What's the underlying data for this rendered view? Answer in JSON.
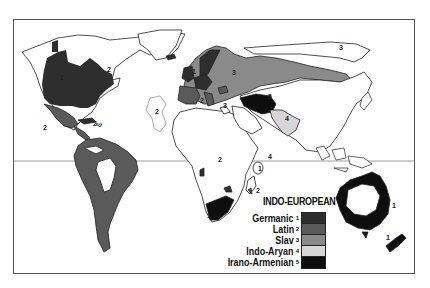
{
  "map": {
    "title": "INDO-EUROPEAN",
    "legend": [
      {
        "number": "1",
        "label": "Germanic",
        "color": "#2e2e2e"
      },
      {
        "number": "2",
        "label": "Latin",
        "color": "#5a5a5a"
      },
      {
        "number": "3",
        "label": "Slav",
        "color": "#8a8a8a"
      },
      {
        "number": "4",
        "label": "Indo-Aryan",
        "color": "#d6d6d6"
      },
      {
        "number": "5",
        "label": "Irano-Armenian",
        "color": "#0e0e0e"
      }
    ],
    "region_labels": [
      {
        "text": "1",
        "x": 60,
        "y": 80
      },
      {
        "text": "2",
        "x": 107,
        "y": 72
      },
      {
        "text": "1",
        "x": 192,
        "y": 74
      },
      {
        "text": "3",
        "x": 232,
        "y": 75
      },
      {
        "text": "2",
        "x": 200,
        "y": 103
      },
      {
        "text": "2",
        "x": 155,
        "y": 114
      },
      {
        "text": "2",
        "x": 43,
        "y": 130
      },
      {
        "text": "2",
        "x": 93,
        "y": 126
      },
      {
        "text": "3",
        "x": 223,
        "y": 108
      },
      {
        "text": "5",
        "x": 268,
        "y": 99
      },
      {
        "text": "4",
        "x": 285,
        "y": 121
      },
      {
        "text": "3",
        "x": 339,
        "y": 50
      },
      {
        "text": "2",
        "x": 218,
        "y": 162
      },
      {
        "text": "1",
        "x": 258,
        "y": 171
      },
      {
        "text": "2",
        "x": 256,
        "y": 193
      },
      {
        "text": "1",
        "x": 207,
        "y": 218
      },
      {
        "text": "4",
        "x": 268,
        "y": 159
      },
      {
        "text": "1",
        "x": 392,
        "y": 208
      },
      {
        "text": "1",
        "x": 386,
        "y": 240
      }
    ],
    "equator": "equator-line"
  }
}
